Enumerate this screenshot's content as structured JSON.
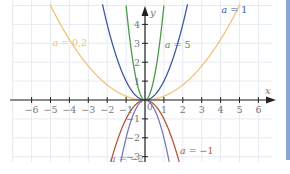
{
  "chart_data": {
    "type": "line",
    "title": "",
    "function": "y = a x^2",
    "xlabel": "x",
    "ylabel": "y",
    "xlim": [
      -7,
      7
    ],
    "ylim": [
      -3.2,
      5.3
    ],
    "grid": true,
    "x_ticks": [
      -6,
      -5,
      -4,
      -3,
      -2,
      -1,
      1,
      2,
      3,
      4,
      5,
      6
    ],
    "y_ticks": [
      -3,
      -2,
      -1,
      1,
      2,
      3,
      4
    ],
    "origin_label": "0",
    "series": [
      {
        "name": "a = 0,2",
        "a": 0.2,
        "color": "#f2c27a",
        "label_pos": [
          -4.9,
          3.0
        ]
      },
      {
        "name": "a = 1",
        "a": 1,
        "color": "#3d5a99",
        "label_pos": [
          4.05,
          4.75
        ]
      },
      {
        "name": "a = 5",
        "a": 5,
        "color": "#4a9a4a",
        "label_pos": [
          1.05,
          2.9
        ]
      },
      {
        "name": "a = −1",
        "a": -1,
        "color": "#b5573a",
        "label_pos": [
          1.85,
          -2.7
        ]
      },
      {
        "name": "a = −2",
        "a": -2,
        "color": "#7a7ab8",
        "label_pos": [
          -1.85,
          -3.1
        ]
      }
    ]
  },
  "colors": {
    "grid": "#e6ebf2",
    "axis": "#222222",
    "tick_label": "#777777",
    "side_bar": "#8aa6d6"
  }
}
